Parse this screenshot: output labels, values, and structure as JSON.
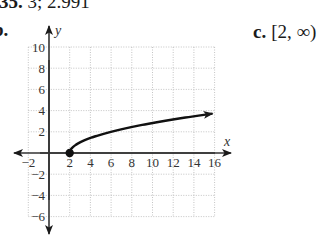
{
  "problem": {
    "number": "35.",
    "answer_a": "3; 2.991",
    "part_b_label": "b.",
    "part_c_label": "c.",
    "part_c_answer": "[2, ∞)"
  },
  "chart_data": {
    "type": "line",
    "title": "",
    "function": "y = sqrt(x - 2)",
    "xlabel": "x",
    "ylabel": "y",
    "xlim": [
      -2,
      16
    ],
    "ylim": [
      -6,
      10
    ],
    "grid": true,
    "grid_style": "dotted",
    "x_ticks": [
      "-2",
      "2",
      "4",
      "6",
      "8",
      "10",
      "12",
      "14",
      "16"
    ],
    "y_ticks": [
      "10",
      "8",
      "6",
      "4",
      "2",
      "-2",
      "-4",
      "-6"
    ],
    "series": [
      {
        "name": "sqrt(x-2)",
        "x": [
          2,
          3,
          4,
          6,
          8,
          10,
          12,
          14,
          15.8
        ],
        "y": [
          0,
          1,
          1.41,
          2,
          2.45,
          2.83,
          3.16,
          3.46,
          3.71
        ],
        "start_point": {
          "x": 2,
          "y": 0,
          "style": "closed-dot"
        },
        "end": "arrow"
      }
    ],
    "axes_arrows": true
  }
}
